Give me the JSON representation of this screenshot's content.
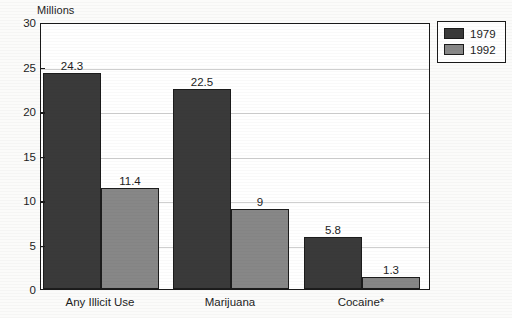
{
  "chart_data": {
    "type": "bar",
    "title": "",
    "subtitle": "",
    "xlabel": "",
    "ylabel": "Millions",
    "categories": [
      "Any Illicit Use",
      "Marijuana",
      "Cocaine*"
    ],
    "series": [
      {
        "name": "1979",
        "color": "#3a3a3a",
        "values": [
          24.3,
          22.5,
          5.8
        ],
        "labels": [
          "24.3",
          "22.5",
          "5.8"
        ]
      },
      {
        "name": "1992",
        "color": "#878787",
        "values": [
          11.4,
          9,
          1.3
        ],
        "labels": [
          "11.4",
          "9",
          "1.3"
        ]
      }
    ],
    "ylim": [
      0,
      30
    ],
    "yticks": [
      0,
      5,
      10,
      15,
      20,
      25,
      30
    ],
    "ytick_labels": [
      "0",
      "5",
      "10",
      "15",
      "20",
      "25",
      "30"
    ],
    "grid": true,
    "legend_position": "top-right",
    "annotations": [
      "Cocaine*"
    ]
  },
  "legend": {
    "items": [
      {
        "label": "1979",
        "color": "#3a3a3a"
      },
      {
        "label": "1992",
        "color": "#878787"
      }
    ]
  },
  "axis": {
    "y_title": "Millions"
  }
}
